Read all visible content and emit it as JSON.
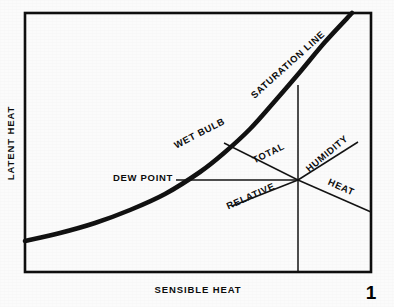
{
  "figure": {
    "kind": "psychrometric-process-diagram",
    "page_number": "1",
    "background_color": "#fbfbfb",
    "ink_color": "#0d0d0d"
  },
  "axes": {
    "x_label": "SENSIBLE HEAT",
    "y_label": "LATENT HEAT"
  },
  "chart_data": {
    "type": "line",
    "title": "",
    "subtitle": "",
    "xlabel": "SENSIBLE HEAT",
    "ylabel": "LATENT HEAT",
    "xlim": [
      0,
      1
    ],
    "ylim": [
      0,
      1
    ],
    "grid": false,
    "legend": "none",
    "plot_frame": {
      "left": 25,
      "top": 13,
      "right": 371,
      "bottom": 272
    },
    "state_point": {
      "x": 298,
      "y": 180
    },
    "series": [
      {
        "name": "SATURATION LINE",
        "role": "saturation-curve",
        "weight": "heavy",
        "points": [
          [
            25,
            241
          ],
          [
            60,
            233
          ],
          [
            95,
            223
          ],
          [
            130,
            210
          ],
          [
            165,
            194
          ],
          [
            200,
            172
          ],
          [
            224,
            153
          ],
          [
            250,
            129
          ],
          [
            275,
            101
          ],
          [
            300,
            72
          ],
          [
            325,
            42
          ],
          [
            352,
            13
          ]
        ]
      },
      {
        "name": "DEW POINT",
        "role": "constant-dew-point-line",
        "weight": "thin",
        "points": [
          [
            176,
            180
          ],
          [
            298,
            180
          ]
        ]
      },
      {
        "name": "WET BULB / TOTAL",
        "role": "total-heat-line",
        "weight": "thin",
        "points": [
          [
            224,
            143
          ],
          [
            298,
            180
          ]
        ]
      },
      {
        "name": "HUMIDITY",
        "role": "humidity-line",
        "weight": "thin",
        "points": [
          [
            298,
            180
          ],
          [
            358,
            142
          ]
        ]
      },
      {
        "name": "RELATIVE",
        "role": "relative-humidity-line",
        "weight": "thin",
        "points": [
          [
            232,
            206
          ],
          [
            298,
            180
          ]
        ]
      },
      {
        "name": "HEAT",
        "role": "sensible-heat-line",
        "weight": "thin",
        "points": [
          [
            298,
            180
          ],
          [
            371,
            212
          ]
        ]
      },
      {
        "name": "VERTICAL",
        "role": "constant-dry-bulb-line",
        "weight": "thin",
        "points": [
          [
            298,
            85
          ],
          [
            298,
            272
          ]
        ]
      }
    ],
    "annotations": [
      {
        "id": "saturation-line",
        "text": "SATURATION LINE",
        "x": 290,
        "y": 67,
        "rotation": -42,
        "anchor": "middle"
      },
      {
        "id": "wet-bulb",
        "text": "WET BULB",
        "x": 201,
        "y": 136,
        "rotation": -27,
        "anchor": "middle"
      },
      {
        "id": "dew-point",
        "text": "DEW POINT",
        "x": 143,
        "y": 181,
        "rotation": 0,
        "anchor": "middle"
      },
      {
        "id": "total",
        "text": "TOTAL",
        "x": 270,
        "y": 156,
        "rotation": -26,
        "anchor": "middle"
      },
      {
        "id": "humidity",
        "text": "HUMIDITY",
        "x": 329,
        "y": 156,
        "rotation": -40,
        "anchor": "middle"
      },
      {
        "id": "relative",
        "text": "RELATIVE",
        "x": 252,
        "y": 199,
        "rotation": -24,
        "anchor": "middle"
      },
      {
        "id": "heat",
        "text": "HEAT",
        "x": 340,
        "y": 190,
        "rotation": 24,
        "anchor": "middle"
      }
    ]
  }
}
